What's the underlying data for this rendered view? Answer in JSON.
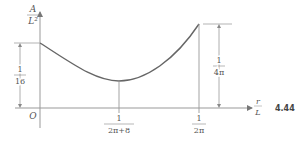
{
  "figure": {
    "number": "4.44"
  },
  "axes": {
    "y_label_num": "A",
    "y_label_den": "L²",
    "x_label_num": "r",
    "x_label_den": "L",
    "origin": "O"
  },
  "ticks": {
    "min_num": "1",
    "min_den": "2π+8",
    "end_num": "1",
    "end_den": "2π"
  },
  "dimensions": {
    "left_num": "1",
    "left_den": "16",
    "right_num": "1",
    "right_den": "4π"
  },
  "colors": {
    "curve": "#666666",
    "axis": "#888888",
    "text": "#555555"
  }
}
